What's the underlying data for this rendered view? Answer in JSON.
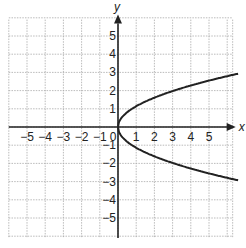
{
  "chart_data": {
    "type": "line",
    "title": "",
    "xlabel": "x",
    "ylabel": "y",
    "xlim": [
      -6,
      6
    ],
    "ylim": [
      -6,
      6
    ],
    "grid": true,
    "x_ticks": [
      "-5",
      "-4",
      "-3",
      "-2",
      "-1",
      "0",
      "1",
      "2",
      "3",
      "4",
      "5"
    ],
    "y_ticks": [
      "5",
      "4",
      "3",
      "2",
      "1",
      "-1",
      "-2",
      "-3",
      "-4",
      "-5"
    ],
    "series": [
      {
        "name": "upper branch",
        "x": [
          0,
          0.25,
          1,
          2,
          3,
          4,
          5,
          6.5
        ],
        "y": [
          0,
          0.57,
          1.14,
          1.61,
          1.97,
          2.28,
          2.55,
          2.9
        ]
      },
      {
        "name": "lower branch",
        "x": [
          0,
          0.25,
          1,
          2,
          3,
          4,
          5,
          6.5
        ],
        "y": [
          0,
          -0.57,
          -1.14,
          -1.61,
          -1.97,
          -2.28,
          -2.55,
          -2.9
        ]
      }
    ],
    "equation_hint": "sideways parabola opening right, vertex at origin"
  }
}
